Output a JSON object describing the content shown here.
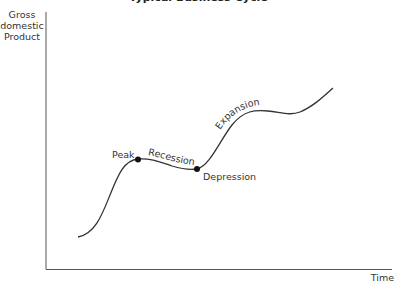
{
  "title": "Typical Business Cycle",
  "axes": {
    "y_label_lines": [
      "Gross",
      "domestic",
      "Product"
    ],
    "x_label": "Time"
  },
  "labels": {
    "peak": "Peak",
    "recession": "Recession",
    "depression": "Depression",
    "expansion": "Expansion"
  },
  "colors": {
    "axis": "#555555",
    "curve": "#333333",
    "text": "#333333",
    "point": "#111111"
  }
}
